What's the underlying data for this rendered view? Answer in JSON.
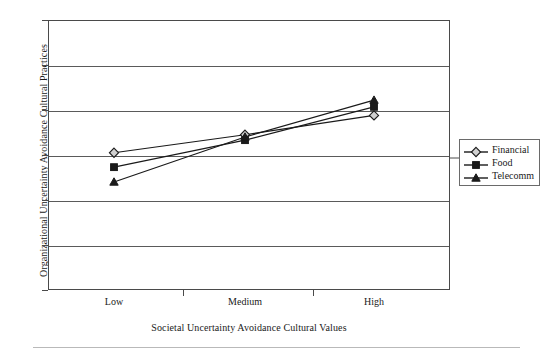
{
  "chart_data": {
    "type": "line",
    "title": "",
    "categories": [
      "Low",
      "Medium",
      "High"
    ],
    "xlabel": "Societal Uncertainty Avoidance Cultural Values",
    "ylabel": "Organizational Uncertainty Avoidance Cultural Practices",
    "ylim": [
      1,
      7
    ],
    "yticks": [
      1,
      2,
      3,
      4,
      5,
      6,
      7
    ],
    "ytick_labels": [
      "1",
      "2",
      "3",
      "4",
      "5",
      "6",
      "7"
    ],
    "grid": true,
    "grid_axis": "y",
    "legend_position": "right",
    "series": [
      {
        "name": "Financial",
        "marker": "diamond",
        "color": "#1a1a1a",
        "values": [
          4.05,
          4.45,
          4.88
        ]
      },
      {
        "name": "Food",
        "marker": "square",
        "color": "#1a1a1a",
        "values": [
          3.73,
          4.33,
          5.07
        ]
      },
      {
        "name": "Telecomm",
        "marker": "triangle",
        "color": "#1a1a1a",
        "values": [
          3.4,
          4.4,
          5.22
        ]
      }
    ]
  },
  "legend": {
    "items": [
      {
        "label": "Financial",
        "marker": "diamond"
      },
      {
        "label": "Food",
        "marker": "square"
      },
      {
        "label": "Telecomm",
        "marker": "triangle"
      }
    ]
  },
  "colors": {
    "axis": "#4a4a4a",
    "gridline": "#5a5a5a",
    "series": "#1a1a1a",
    "background": "#ffffff",
    "footer_rule": "#b9b9b9"
  }
}
